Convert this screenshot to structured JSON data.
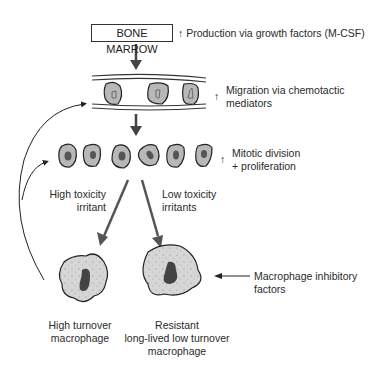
{
  "diagram": {
    "source_node": {
      "label": "BONE MARROW"
    },
    "annotations": {
      "production": {
        "arrow": "↑",
        "text": "Production via growth factors (M-CSF)"
      },
      "migration": {
        "arrow": "↑",
        "line1": "Migration via chemotactic",
        "line2": "mediators"
      },
      "mitotic": {
        "arrow": "↑",
        "line1": "Mitotic division",
        "line2": "+ proliferation"
      },
      "high_tox": {
        "line1": "High toxicity",
        "line2": "irritant"
      },
      "low_tox": {
        "line1": "Low toxicity",
        "line2": "irritants"
      },
      "inhibitory": {
        "line1": "Macrophage inhibitory",
        "line2": "factors"
      }
    },
    "outcomes": {
      "high_turnover": {
        "line1": "High turnover",
        "line2": "macrophage"
      },
      "resistant": {
        "line1": "Resistant",
        "line2": "long-lived low turnover",
        "line3": "macrophage"
      }
    },
    "colors": {
      "cell_fill": "#b8b8b8",
      "macrophage_fill": "#d4d4d4",
      "nucleus": "#555555",
      "arrow": "#555555",
      "line": "#333333"
    }
  }
}
